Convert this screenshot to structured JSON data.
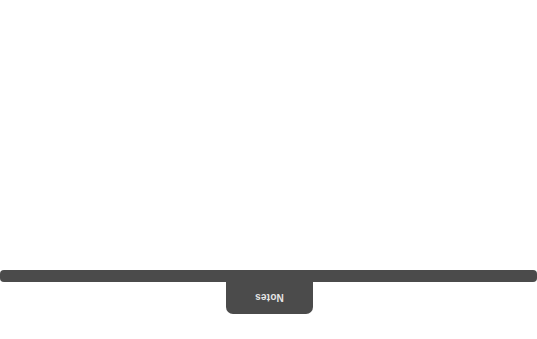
{
  "notes_panel": {
    "tab_label": "Notes",
    "label_orientation": "rotated-180",
    "bar_color": "#4b4b4b",
    "label_color": "#e6e6e6",
    "state": "collapsed"
  }
}
